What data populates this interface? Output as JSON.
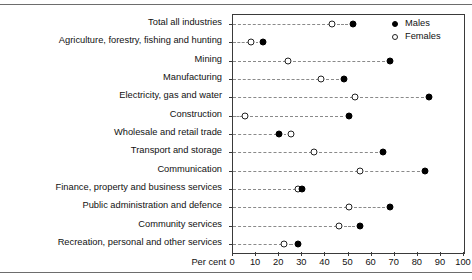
{
  "chart_data": {
    "type": "scatter",
    "title": "",
    "xlabel": "Per cent",
    "ylabel": "",
    "xlim": [
      0,
      100
    ],
    "xticks": [
      0,
      10,
      20,
      30,
      40,
      50,
      60,
      70,
      80,
      90,
      100
    ],
    "grid": "horizontal-dashed",
    "legend_position": "top-right",
    "categories": [
      "Total all industries",
      "Agriculture, forestry, fishing and hunting",
      "Mining",
      "Manufacturing",
      "Electricity, gas and water",
      "Construction",
      "Wholesale and retail trade",
      "Transport and storage",
      "Communication",
      "Finance, property and business services",
      "Public administration and defence",
      "Community services",
      "Recreation, personal and other services"
    ],
    "series": [
      {
        "name": "Males",
        "marker": "filled-circle",
        "color": "#000000",
        "values": [
          52,
          13,
          68,
          48,
          85,
          50,
          20,
          65,
          83,
          30,
          68,
          55,
          28
        ]
      },
      {
        "name": "Females",
        "marker": "open-circle",
        "color": "#ffffff",
        "values": [
          43,
          8,
          24,
          38,
          53,
          5,
          25,
          35,
          55,
          28,
          50,
          46,
          22
        ]
      }
    ]
  },
  "legend": {
    "items": [
      {
        "label": "Males",
        "marker": "filled-circle"
      },
      {
        "label": "Females",
        "marker": "open-circle"
      }
    ]
  },
  "axis": {
    "x_title": "Per cent",
    "tick_labels": [
      "0",
      "10",
      "20",
      "30",
      "40",
      "50",
      "60",
      "70",
      "80",
      "90",
      "100"
    ]
  }
}
